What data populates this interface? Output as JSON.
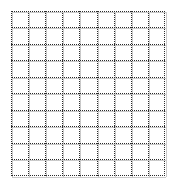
{
  "page": {
    "kind": "grid-sheet",
    "background_color": "#ffffff"
  },
  "grid": {
    "label": "Grid",
    "columns": 9,
    "rows": 10,
    "cell_width_px": 17.1,
    "cell_height_px": 16.5,
    "origin_x_px": 11,
    "origin_y_px": 11,
    "width_px": 154,
    "height_px": 165,
    "solid_line_color": "#c9c9c9",
    "dotted_line_color": "#2b2b2b",
    "solid_line_style": "solid",
    "dotted_line_style": "dotted",
    "layer_offset_px": 1
  },
  "chart_data": {
    "type": "table",
    "title": "",
    "xlabel": "",
    "ylabel": "",
    "categories": [],
    "values": [],
    "grid": true,
    "legend": "none",
    "note": "Empty grid / graph-paper pattern: no data series, labels, ticks or legend are rendered."
  }
}
